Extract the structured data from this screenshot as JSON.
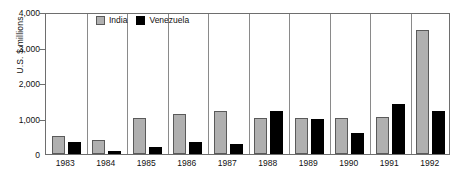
{
  "chart_data": {
    "type": "bar",
    "title": "",
    "subtitle": "",
    "xlabel": "",
    "ylabel": "U.S. $ millions",
    "ylim": [
      0,
      4000
    ],
    "yticks": [
      0,
      1000,
      2000,
      3000,
      4000
    ],
    "ytick_labels": [
      "0",
      "1,000",
      "2,000",
      "3,000",
      "4,000"
    ],
    "grid": false,
    "group_separators": true,
    "legend_position": "top-left-inside",
    "categories": [
      "1983",
      "1984",
      "1985",
      "1986",
      "1987",
      "1988",
      "1989",
      "1990",
      "1991",
      "1992"
    ],
    "series": [
      {
        "name": "India",
        "color": "#b0b0b0",
        "edge_color": "#5a5a5a",
        "values": [
          500,
          400,
          1020,
          1120,
          1220,
          1020,
          1020,
          1020,
          1040,
          3500
        ]
      },
      {
        "name": "Venezuela",
        "color": "#000000",
        "edge_color": "#000000",
        "values": [
          350,
          80,
          210,
          350,
          270,
          1200,
          1000,
          580,
          1400,
          1200
        ]
      }
    ]
  },
  "legend": {
    "entries": [
      {
        "label": "India",
        "swatch": "india"
      },
      {
        "label": "Venezuela",
        "swatch": "venezuela"
      }
    ]
  }
}
